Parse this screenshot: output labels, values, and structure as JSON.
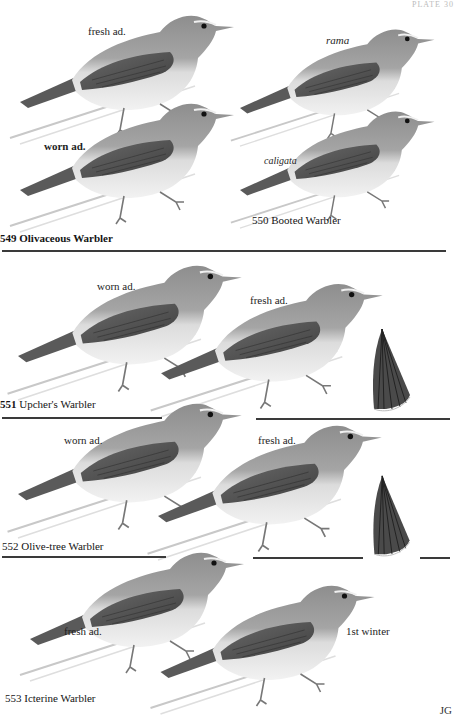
{
  "page": {
    "plate_number": "PLATE 30",
    "artist_initials": "JG"
  },
  "sections": [
    {
      "id": "549",
      "caption_number": "549",
      "caption_name": "Olivaceous Warbler",
      "birds": [
        {
          "label": "fresh ad.",
          "italic": false
        },
        {
          "label": "worn ad.",
          "italic": false
        }
      ]
    },
    {
      "id": "550",
      "caption_number": "550",
      "caption_name": "Booted Warbler",
      "birds": [
        {
          "label": "rama",
          "italic": true
        },
        {
          "label": "caligata",
          "italic": true
        }
      ]
    },
    {
      "id": "551",
      "caption_number": "551",
      "caption_name": "Upcher's Warbler",
      "birds": [
        {
          "label": "worn ad.",
          "italic": false
        },
        {
          "label": "fresh ad.",
          "italic": false
        }
      ],
      "extra": "tail-detail"
    },
    {
      "id": "552",
      "caption_number": "552",
      "caption_name": "Olive-tree Warbler",
      "birds": [
        {
          "label": "worn ad.",
          "italic": false
        },
        {
          "label": "fresh ad.",
          "italic": false
        }
      ],
      "extra": "tail-detail"
    },
    {
      "id": "553",
      "caption_number": "553",
      "caption_name": "Icterine Warbler",
      "birds": [
        {
          "label": "fresh ad.",
          "italic": false
        },
        {
          "label": "1st winter",
          "italic": false
        }
      ]
    }
  ],
  "colors": {
    "background": "#ffffff",
    "bird_upper": "#8a8a8a",
    "bird_wing": "#5c5c5c",
    "bird_under": "#e4e4e4",
    "rule": "#3a3a3a",
    "tail": "#4a4a4a"
  }
}
